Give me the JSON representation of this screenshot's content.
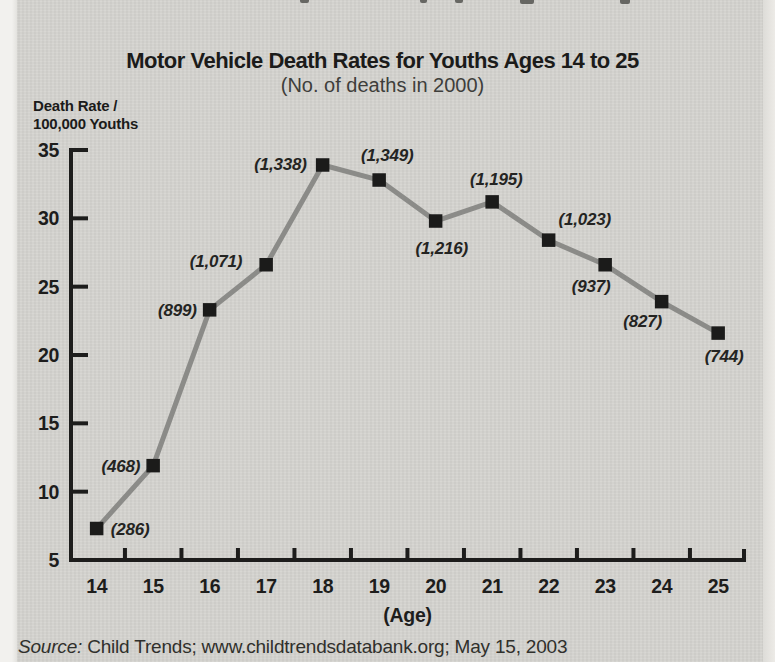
{
  "page": {
    "title": "Motor Vehicle Death Rates for Youths Ages 14 to 25",
    "subtitle": "(No. of deaths in 2000)",
    "y_axis_unit": [
      "Death Rate /",
      "100,000 Youths"
    ],
    "source_prefix": "Source:",
    "source_text": " Child Trends; www.childtrendsdatabank.org; May 15, 2003"
  },
  "chart_data": {
    "type": "line",
    "title": "Motor Vehicle Death Rates for Youths Ages 14 to 25",
    "subtitle": "(No. of deaths in 2000)",
    "xlabel": "(Age)",
    "ylabel": "Death Rate / 100,000 Youths",
    "x": [
      14,
      15,
      16,
      17,
      18,
      19,
      20,
      21,
      22,
      23,
      24,
      25
    ],
    "series": [
      {
        "name": "Motor vehicle death rate per 100,000 youths",
        "values": [
          7.3,
          11.9,
          23.3,
          26.6,
          33.9,
          32.8,
          29.8,
          31.2,
          28.4,
          26.6,
          23.9,
          21.6
        ]
      }
    ],
    "point_labels": [
      "(286)",
      "(468)",
      "(899)",
      "(1,071)",
      "(1,338)",
      "(1,349)",
      "(1,216)",
      "(1,195)",
      "(1,023)",
      "(937)",
      "(827)",
      "(744)"
    ],
    "ylim": [
      5,
      35
    ],
    "yticks": [
      5,
      10,
      15,
      20,
      25,
      30,
      35
    ],
    "grid": false,
    "legend": "none",
    "line_color": "#8b8b88",
    "marker": "square",
    "marker_color": "#1b1b1a",
    "axis_color": "#1d1d1c",
    "label_offsets": [
      {
        "anchor": "start",
        "dx": 14,
        "dy": 6
      },
      {
        "anchor": "end",
        "dx": -13,
        "dy": 6
      },
      {
        "anchor": "end",
        "dx": -13,
        "dy": 6
      },
      {
        "anchor": "end",
        "dx": -24,
        "dy": 2
      },
      {
        "anchor": "end",
        "dx": -16,
        "dy": 5
      },
      {
        "anchor": "middle",
        "dx": 8,
        "dy": -19
      },
      {
        "anchor": "middle",
        "dx": 6,
        "dy": 33
      },
      {
        "anchor": "middle",
        "dx": 4,
        "dy": -17
      },
      {
        "anchor": "middle",
        "dx": 36,
        "dy": -15
      },
      {
        "anchor": "middle",
        "dx": -14,
        "dy": 27
      },
      {
        "anchor": "middle",
        "dx": -19,
        "dy": 25
      },
      {
        "anchor": "middle",
        "dx": 6,
        "dy": 29
      }
    ]
  }
}
